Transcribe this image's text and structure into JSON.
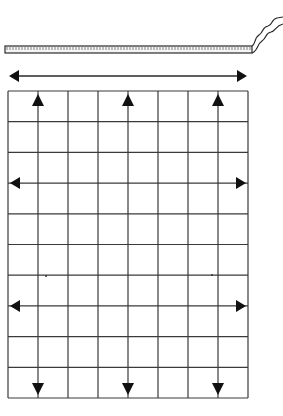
{
  "diagram": {
    "colors": {
      "background": "#ffffff",
      "line": "#2a2a2a",
      "grid_line": "#3a3a3a",
      "arrow": "#111111",
      "tape_fill": "#f4f4f4",
      "tape_tick": "#555555"
    },
    "tape": {
      "x_start": 5,
      "x_end": 252,
      "y_top": 46,
      "y_bottom": 53,
      "tick_spacing": 3,
      "curl": true
    },
    "top_arrow": {
      "direction": "horizontal-double",
      "x1": 9,
      "x2": 247,
      "y": 76
    },
    "grid": {
      "x": 8,
      "y": 91,
      "width": 240,
      "height": 307,
      "columns": 8,
      "rows": 10
    },
    "vertical_arrows": [
      {
        "column_line": 1,
        "direction": "double"
      },
      {
        "column_line": 4,
        "direction": "double"
      },
      {
        "column_line": 7,
        "direction": "double"
      }
    ],
    "horizontal_arrows": [
      {
        "row_line": 3,
        "direction": "double"
      },
      {
        "row_line": 7,
        "direction": "double"
      }
    ],
    "specks": [
      {
        "x": 46,
        "y": 276
      },
      {
        "x": 212,
        "y": 275
      }
    ]
  }
}
